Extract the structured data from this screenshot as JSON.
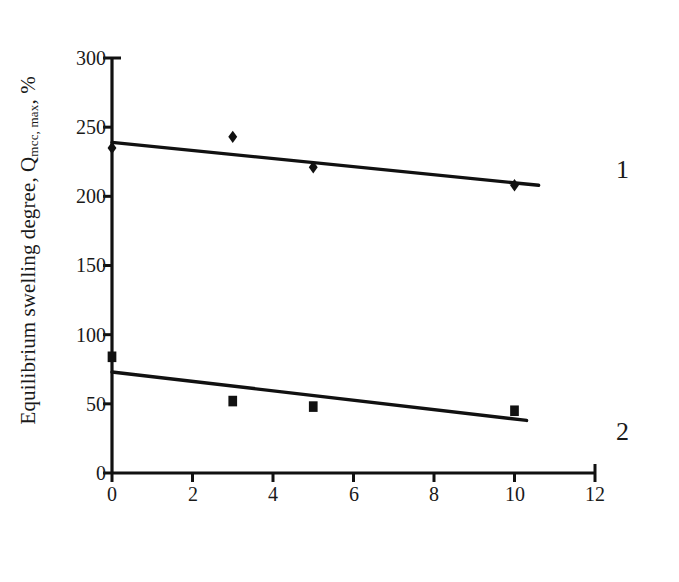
{
  "chart_data": {
    "type": "scatter",
    "title": "",
    "xlabel": "Content of MCC, mass % in the rubber",
    "ylabel_main": "Equilibrium swelling degree, Q",
    "ylabel_sub": "mcc, max",
    "ylabel_tail": ", %",
    "xlim": [
      0,
      12
    ],
    "ylim": [
      0,
      300
    ],
    "xticks": [
      0,
      2,
      4,
      6,
      8,
      10,
      12
    ],
    "yticks": [
      0,
      50,
      100,
      150,
      200,
      250,
      300
    ],
    "xtick_labels": [
      "0",
      "2",
      "4",
      "6",
      "8",
      "10",
      "12"
    ],
    "ytick_labels": [
      "0",
      "50",
      "100",
      "150",
      "200",
      "250",
      "300"
    ],
    "grid": false,
    "legend_position": "right-inline",
    "series": [
      {
        "name": "1",
        "marker": "diamond",
        "color": "#111111",
        "points": [
          {
            "x": 0,
            "y": 235
          },
          {
            "x": 3,
            "y": 243
          },
          {
            "x": 5,
            "y": 221
          },
          {
            "x": 10,
            "y": 208
          }
        ],
        "trendline": {
          "x0": 0,
          "y0": 239,
          "x1": 10.6,
          "y1": 208
        }
      },
      {
        "name": "2",
        "marker": "square",
        "color": "#111111",
        "points": [
          {
            "x": 0,
            "y": 84
          },
          {
            "x": 3,
            "y": 52
          },
          {
            "x": 5,
            "y": 48
          },
          {
            "x": 10,
            "y": 45
          }
        ],
        "trendline": {
          "x0": 0,
          "y0": 73,
          "x1": 10.3,
          "y1": 38
        }
      }
    ],
    "annotations": [
      {
        "label": "1",
        "x": 12.5,
        "y": 215
      },
      {
        "label": "2",
        "x": 12.5,
        "y": 60
      }
    ]
  },
  "axis": {
    "line_color": "#111111"
  }
}
